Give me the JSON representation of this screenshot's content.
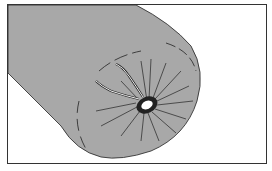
{
  "illustration": {
    "subject": "gathered fabric bolster roll with drawstring end",
    "colors": {
      "fabric": "#a8a8a8",
      "outline": "#222222",
      "background": "#ffffff",
      "frame": "#333333"
    }
  }
}
